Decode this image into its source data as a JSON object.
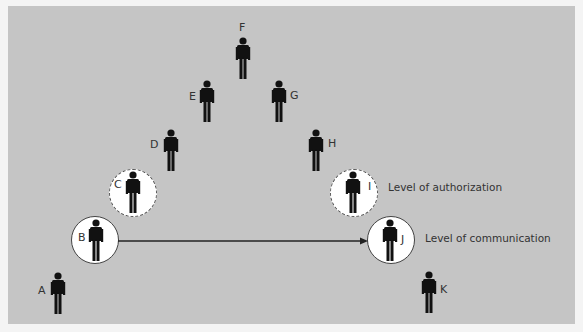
{
  "diagram": {
    "type": "hierarchy-pyramid",
    "people": [
      {
        "id": "A",
        "label": "A"
      },
      {
        "id": "B",
        "label": "B",
        "highlight": "solid-circle"
      },
      {
        "id": "C",
        "label": "C",
        "highlight": "dashed-circle"
      },
      {
        "id": "D",
        "label": "D"
      },
      {
        "id": "E",
        "label": "E"
      },
      {
        "id": "F",
        "label": "F"
      },
      {
        "id": "G",
        "label": "G"
      },
      {
        "id": "H",
        "label": "H"
      },
      {
        "id": "I",
        "label": "I",
        "highlight": "dashed-circle"
      },
      {
        "id": "J",
        "label": "J",
        "highlight": "solid-circle"
      },
      {
        "id": "K",
        "label": "K"
      }
    ],
    "edges": [
      {
        "from": "B",
        "to": "J",
        "style": "arrow"
      }
    ],
    "annotations": {
      "authorization": "Level of authorization",
      "communication": "Level of communication"
    },
    "colors": {
      "background": "#c5c5c5",
      "figure": "#111111",
      "circle_fill": "#ffffff"
    }
  }
}
